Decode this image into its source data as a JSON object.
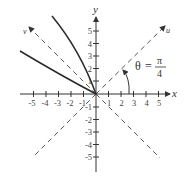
{
  "diagram": {
    "axes": {
      "x_label": "x",
      "y_label": "y",
      "x_ticks": [
        "-5",
        "-4",
        "-3",
        "-2",
        "-1",
        "1",
        "2",
        "3",
        "4",
        "5"
      ],
      "y_ticks": [
        "5",
        "4",
        "3",
        "2",
        "1",
        "-1",
        "-2",
        "-3",
        "-4",
        "-5"
      ],
      "range": [
        -5,
        5
      ]
    },
    "rotated_axes": {
      "u_label": "u",
      "v_label": "v",
      "style": "dashed"
    },
    "angle_annotation": {
      "theta": "θ",
      "equals": "=",
      "numerator": "π",
      "denominator": "4"
    },
    "curves": [
      {
        "name": "upper-branch",
        "description": "curve from origin upward-left"
      },
      {
        "name": "lower-branch",
        "description": "curve from origin leftward"
      }
    ],
    "colors": {
      "axis": "#333333",
      "curve": "#2a2a2a",
      "dashed": "#555555"
    }
  }
}
